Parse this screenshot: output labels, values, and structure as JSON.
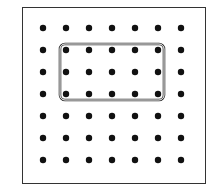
{
  "diagram": {
    "type": "geoboard",
    "grid": {
      "rows": 7,
      "cols": 7,
      "origin_x": 43,
      "origin_y": 28,
      "spacing_x": 23,
      "spacing_y": 22,
      "dot_radius": 3.2
    },
    "band": {
      "shape": "rectangle",
      "from_col": 1,
      "to_col": 5,
      "from_row": 1,
      "to_row": 3,
      "color": "#333333"
    },
    "colors": {
      "dot": "#111111",
      "border": "#333333",
      "background": "#ffffff"
    }
  }
}
